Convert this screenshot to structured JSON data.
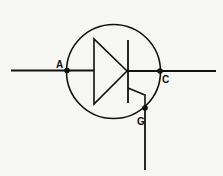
{
  "diagram": {
    "type": "schematic-symbol",
    "component": "SCR",
    "colors": {
      "background": "#f6f6f3",
      "stroke": "#111111"
    },
    "terminals": [
      {
        "id": "anode",
        "label": "A"
      },
      {
        "id": "cathode",
        "label": "C"
      },
      {
        "id": "gate",
        "label": "G"
      }
    ]
  }
}
